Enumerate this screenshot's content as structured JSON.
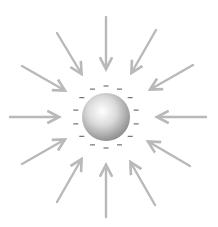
{
  "diagram": {
    "sphere": {
      "cx": 106,
      "cy": 117,
      "r": 24,
      "charge": "negative"
    },
    "charge_symbol": "−",
    "charge_ring_radius": 31,
    "charge_count": 14,
    "colors": {
      "arrow": "#b9b9b9",
      "charge": "#555555",
      "sphere_light": "#ffffff",
      "sphere_mid": "#d4d4d4",
      "sphere_dark": "#8a8a8a",
      "background": "#ffffff"
    },
    "arrows": [
      {
        "name": "arrow-top",
        "x1": 106,
        "y1": 17,
        "x2": 106,
        "y2": 68
      },
      {
        "name": "arrow-upper-left",
        "x1": 57,
        "y1": 33,
        "x2": 81,
        "y2": 73
      },
      {
        "name": "arrow-upper-right",
        "x1": 156,
        "y1": 30,
        "x2": 132,
        "y2": 72
      },
      {
        "name": "arrow-left-upper",
        "x1": 22,
        "y1": 66,
        "x2": 64,
        "y2": 90
      },
      {
        "name": "arrow-right-upper",
        "x1": 193,
        "y1": 65,
        "x2": 151,
        "y2": 89
      },
      {
        "name": "arrow-left",
        "x1": 10,
        "y1": 117,
        "x2": 58,
        "y2": 117
      },
      {
        "name": "arrow-right",
        "x1": 206,
        "y1": 117,
        "x2": 158,
        "y2": 117
      },
      {
        "name": "arrow-left-lower",
        "x1": 22,
        "y1": 164,
        "x2": 64,
        "y2": 140
      },
      {
        "name": "arrow-right-lower",
        "x1": 190,
        "y1": 166,
        "x2": 149,
        "y2": 142
      },
      {
        "name": "arrow-lower-left",
        "x1": 57,
        "y1": 202,
        "x2": 81,
        "y2": 160
      },
      {
        "name": "arrow-lower-right",
        "x1": 155,
        "y1": 205,
        "x2": 131,
        "y2": 163
      },
      {
        "name": "arrow-bottom",
        "x1": 106,
        "y1": 217,
        "x2": 106,
        "y2": 166
      }
    ]
  }
}
